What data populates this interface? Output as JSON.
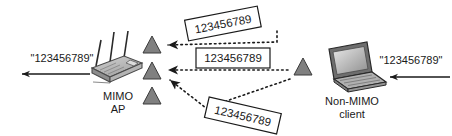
{
  "diagram": {
    "background_color": "#ffffff",
    "stroke_color": "#1a1a1a",
    "triangle_fill": "#808080",
    "triangle_stroke": "#3a3a3a",
    "device_fill_light": "#c8c8c8",
    "device_fill_mid": "#9a9a9a",
    "device_fill_dark": "#6e6e6e",
    "nodes": {
      "ap": {
        "label_line1": "MIMO",
        "label_line2": "AP",
        "icon": "wireless-router-icon",
        "antenna_count": 3
      },
      "client": {
        "label_line1": "Non-MIMO",
        "label_line2": "client",
        "icon": "laptop-icon"
      }
    },
    "packet_labels": [
      {
        "id": "packet-top",
        "text": "123456789",
        "rotation": -11
      },
      {
        "id": "packet-middle",
        "text": "123456789",
        "rotation": 0
      },
      {
        "id": "packet-bottom",
        "text": "123456789",
        "rotation": 13
      }
    ],
    "stream_arrows": [
      {
        "id": "stream-top",
        "style": "dotted"
      },
      {
        "id": "stream-middle",
        "style": "dotted"
      },
      {
        "id": "stream-bottom",
        "style": "dotted"
      }
    ],
    "antenna_markers": {
      "ap_side_count": 3,
      "client_side_count": 1
    },
    "io_labels": {
      "output": "\"123456789\"",
      "input": "\"123456789\""
    },
    "io_arrows": [
      {
        "id": "output-arrow",
        "direction": "left",
        "style": "solid"
      },
      {
        "id": "input-arrow",
        "direction": "left",
        "style": "solid"
      }
    ]
  }
}
